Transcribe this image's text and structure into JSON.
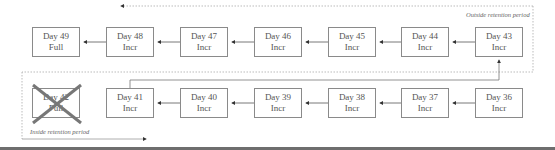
{
  "diagram": {
    "outside_label": "Outside retention period",
    "inside_label": "Inside retention period",
    "top_row": [
      {
        "day": "Day 49",
        "type": "Full",
        "x": 32
      },
      {
        "day": "Day 48",
        "type": "Incr",
        "x": 106
      },
      {
        "day": "Day 47",
        "type": "Incr",
        "x": 180
      },
      {
        "day": "Day 46",
        "type": "Incr",
        "x": 254
      },
      {
        "day": "Day 45",
        "type": "Incr",
        "x": 328
      },
      {
        "day": "Day 44",
        "type": "Incr",
        "x": 401
      },
      {
        "day": "Day 43",
        "type": "Incr",
        "x": 475
      }
    ],
    "bottom_row": [
      {
        "day": "Day 42",
        "type": "Full",
        "x": 32,
        "deleted": true
      },
      {
        "day": "Day 41",
        "type": "Incr",
        "x": 106
      },
      {
        "day": "Day 40",
        "type": "Incr",
        "x": 180
      },
      {
        "day": "Day 39",
        "type": "Incr",
        "x": 254
      },
      {
        "day": "Day 38",
        "type": "Incr",
        "x": 328
      },
      {
        "day": "Day 37",
        "type": "Incr",
        "x": 401
      },
      {
        "day": "Day 36",
        "type": "Incr",
        "x": 475
      }
    ],
    "colors": {
      "box_border": "#8a8a8a",
      "line": "#555555",
      "cross": "#777777",
      "dotted": "#aaaaaa",
      "bar": "#6e6e6e"
    }
  }
}
